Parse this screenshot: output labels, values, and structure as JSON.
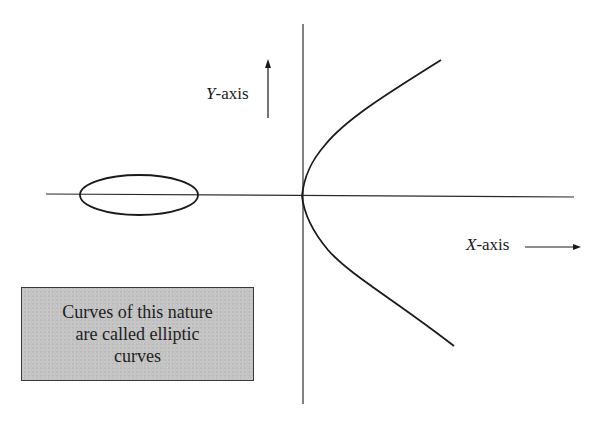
{
  "diagram": {
    "y_axis": {
      "variable": "Y",
      "suffix": "-axis",
      "arrow_direction": "up"
    },
    "x_axis": {
      "variable": "X",
      "suffix": "-axis",
      "arrow_direction": "right"
    },
    "note": {
      "lines": [
        "Curves of this nature",
        "are called elliptic",
        "curves"
      ],
      "background_color": "#c4c4c4",
      "border_color": "#3a3a3a"
    },
    "shapes": {
      "closed_oval": "ellipse-component-left-of-origin",
      "open_branch": "parabola-like-branch-opening-right"
    },
    "colors": {
      "stroke": "#1a1a1a",
      "background": "#ffffff"
    }
  }
}
